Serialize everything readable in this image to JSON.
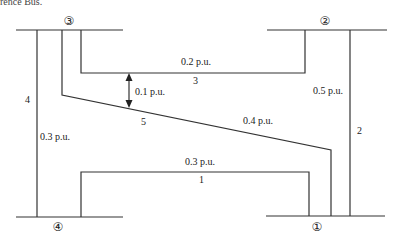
{
  "header": {
    "clipped_text": "rence Bus."
  },
  "buses": [
    {
      "id": "bus-1",
      "label": "①"
    },
    {
      "id": "bus-2",
      "label": "②"
    },
    {
      "id": "bus-3",
      "label": "③"
    },
    {
      "id": "bus-4",
      "label": "④"
    }
  ],
  "lines": [
    {
      "number": "1",
      "impedance": "0.3 p.u.",
      "from": "4",
      "to": "1"
    },
    {
      "number": "2",
      "impedance": "0.5 p.u.",
      "from": "2",
      "to": "1"
    },
    {
      "number": "3",
      "impedance": "0.2 p.u.",
      "from": "3",
      "to": "2"
    },
    {
      "number": "4",
      "impedance": "0.3 p.u.",
      "from": "3",
      "to": "4"
    },
    {
      "number": "5",
      "impedance": "0.4 p.u.",
      "from": "3",
      "to": "1"
    }
  ],
  "mutual": {
    "label": "0.1 p.u.",
    "between": [
      "3",
      "5"
    ]
  }
}
